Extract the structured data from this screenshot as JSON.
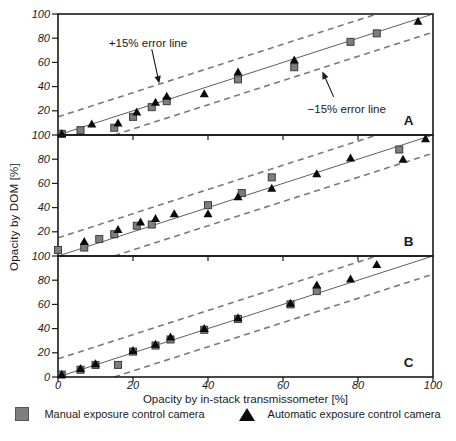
{
  "figure": {
    "y_axis_label": "Opacity by DOM [%]",
    "x_axis_label": "Opacity by in-stack transmissometer [%]",
    "x_tick_labels": [
      "0",
      "20",
      "40",
      "60",
      "80",
      "100"
    ],
    "legend": [
      {
        "marker": "square-icon",
        "label": "Manual exposure control camera",
        "color": "#7e7e7e"
      },
      {
        "marker": "triangle-icon",
        "label": "Automatic exposure control camera",
        "color": "#0a0a0a"
      }
    ],
    "colors": {
      "axis": "#1a1a1a",
      "identity_line": "#4d4d4d",
      "error_line": "#7a7a7a",
      "square_fill": "#7e7e7e",
      "square_edge": "#3c3c3c",
      "triangle_fill": "#0a0a0a",
      "text": "#1a1a1a"
    }
  },
  "chart_data": [
    {
      "type": "scatter",
      "panel_label": "A",
      "xlim": [
        0,
        100
      ],
      "ylim": [
        0,
        100
      ],
      "x_ticks": [
        20,
        40,
        60,
        80
      ],
      "y_ticks": [
        100,
        80,
        60,
        40,
        20
      ],
      "grid": false,
      "reference_lines": [
        {
          "name": "identity",
          "style": "solid",
          "from": [
            0,
            0
          ],
          "to": [
            100,
            100
          ]
        },
        {
          "name": "+15% error line",
          "style": "dashed",
          "from": [
            0,
            15
          ],
          "to": [
            85,
            100
          ]
        },
        {
          "name": "-15% error line",
          "style": "dashed",
          "from": [
            15,
            0
          ],
          "to": [
            100,
            85
          ]
        }
      ],
      "annotations": [
        {
          "text": "+15% error line",
          "text_xy": [
            24,
            76
          ],
          "arrow_from": [
            25,
            71
          ],
          "arrow_to": [
            27,
            42.5
          ]
        },
        {
          "text": "−15% error line",
          "text_xy": [
            77,
            21.5
          ],
          "arrow_from": [
            73.5,
            31.5
          ],
          "arrow_to": [
            70.5,
            52.5
          ]
        }
      ],
      "series": [
        {
          "name": "Manual exposure control camera",
          "marker": "square",
          "points": [
            [
              1,
              1
            ],
            [
              6,
              4
            ],
            [
              15,
              6
            ],
            [
              20,
              15
            ],
            [
              25,
              23
            ],
            [
              29,
              28
            ],
            [
              48,
              46
            ],
            [
              63,
              56
            ],
            [
              78,
              77
            ],
            [
              85,
              84
            ]
          ]
        },
        {
          "name": "Automatic exposure control camera",
          "marker": "triangle",
          "points": [
            [
              1,
              1
            ],
            [
              9,
              9
            ],
            [
              16,
              10
            ],
            [
              21,
              19
            ],
            [
              26,
              27
            ],
            [
              29,
              32
            ],
            [
              39,
              34
            ],
            [
              48,
              52
            ],
            [
              63,
              62
            ],
            [
              96,
              94
            ]
          ]
        }
      ]
    },
    {
      "type": "scatter",
      "panel_label": "B",
      "xlim": [
        0,
        100
      ],
      "ylim": [
        0,
        100
      ],
      "x_ticks": [
        20,
        40,
        60,
        80
      ],
      "y_ticks": [
        100,
        80,
        60,
        40,
        20
      ],
      "grid": false,
      "reference_lines": [
        {
          "name": "identity",
          "style": "solid",
          "from": [
            0,
            0
          ],
          "to": [
            100,
            100
          ]
        },
        {
          "name": "+15% error line",
          "style": "dashed",
          "from": [
            0,
            15
          ],
          "to": [
            85,
            100
          ]
        },
        {
          "name": "-15% error line",
          "style": "dashed",
          "from": [
            15,
            0
          ],
          "to": [
            100,
            85
          ]
        }
      ],
      "annotations": [],
      "series": [
        {
          "name": "Manual exposure control camera",
          "marker": "square",
          "points": [
            [
              0,
              5
            ],
            [
              7,
              7
            ],
            [
              11,
              14
            ],
            [
              15,
              18
            ],
            [
              21,
              25
            ],
            [
              25,
              26
            ],
            [
              40,
              42
            ],
            [
              49,
              52
            ],
            [
              57,
              65
            ],
            [
              91,
              88
            ]
          ]
        },
        {
          "name": "Automatic exposure control camera",
          "marker": "triangle",
          "points": [
            [
              7,
              12
            ],
            [
              16,
              22
            ],
            [
              22,
              28
            ],
            [
              26,
              31
            ],
            [
              31,
              35
            ],
            [
              40,
              35
            ],
            [
              48,
              49
            ],
            [
              57,
              56
            ],
            [
              69,
              68
            ],
            [
              78,
              81
            ],
            [
              92,
              80
            ],
            [
              98,
              97
            ]
          ]
        }
      ]
    },
    {
      "type": "scatter",
      "panel_label": "C",
      "xlim": [
        0,
        100
      ],
      "ylim": [
        0,
        100
      ],
      "x_ticks": [
        0,
        20,
        40,
        60,
        80,
        100
      ],
      "y_ticks": [
        100,
        80,
        60,
        40,
        20,
        0
      ],
      "grid": false,
      "reference_lines": [
        {
          "name": "identity",
          "style": "solid",
          "from": [
            0,
            0
          ],
          "to": [
            100,
            100
          ]
        },
        {
          "name": "+15% error line",
          "style": "dashed",
          "from": [
            0,
            15
          ],
          "to": [
            85,
            100
          ]
        },
        {
          "name": "-15% error line",
          "style": "dashed",
          "from": [
            15,
            0
          ],
          "to": [
            100,
            85
          ]
        }
      ],
      "annotations": [],
      "series": [
        {
          "name": "Manual exposure control camera",
          "marker": "square",
          "points": [
            [
              1,
              2
            ],
            [
              6,
              6
            ],
            [
              10,
              10
            ],
            [
              16,
              10
            ],
            [
              20,
              21
            ],
            [
              26,
              26
            ],
            [
              30,
              31
            ],
            [
              39,
              39
            ],
            [
              48,
              48
            ],
            [
              62,
              60
            ],
            [
              69,
              71
            ]
          ]
        },
        {
          "name": "Automatic exposure control camera",
          "marker": "triangle",
          "points": [
            [
              1,
              2
            ],
            [
              6,
              7
            ],
            [
              10,
              11
            ],
            [
              20,
              22
            ],
            [
              26,
              27
            ],
            [
              30,
              33
            ],
            [
              39,
              40
            ],
            [
              48,
              49
            ],
            [
              62,
              61
            ],
            [
              69,
              76
            ],
            [
              78,
              81
            ],
            [
              85,
              93
            ]
          ]
        }
      ]
    }
  ]
}
